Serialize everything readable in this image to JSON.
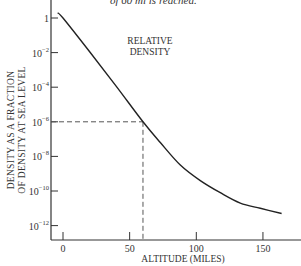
{
  "caption": {
    "text": "of 60 mi is reached."
  },
  "chart_data": {
    "type": "line",
    "title": "",
    "annotation": "RELATIVE DENSITY",
    "annotation_lines": [
      "RELATIVE",
      "DENSITY"
    ],
    "xlabel": "ALTITUDE (MILES)",
    "ylabel_lines": [
      "DENSITY AS A FRACTION",
      "OF DENSITY AT SEA LEVEL"
    ],
    "ylabel": "DENSITY AS A FRACTION OF DENSITY AT SEA LEVEL",
    "yscale": "log",
    "xlim": [
      -10,
      175
    ],
    "ylim_log10": [
      -13,
      0.3
    ],
    "x_ticks": [
      0,
      50,
      100,
      150
    ],
    "x_tick_labels": [
      "0",
      "50",
      "100",
      "150"
    ],
    "y_ticks_log10": [
      0,
      -2,
      -4,
      -6,
      -8,
      -10,
      -12
    ],
    "y_tick_labels": [
      {
        "base": "1",
        "exp": ""
      },
      {
        "base": "10",
        "exp": "−2"
      },
      {
        "base": "10",
        "exp": "−4"
      },
      {
        "base": "10",
        "exp": "−6"
      },
      {
        "base": "10",
        "exp": "−8"
      },
      {
        "base": "10",
        "exp": "−10"
      },
      {
        "base": "10",
        "exp": "−12"
      }
    ],
    "grid": false,
    "series": [
      {
        "name": "Relative density",
        "x": [
          -4,
          0,
          20,
          40,
          60,
          73,
          88,
          103,
          118,
          133,
          148,
          164
        ],
        "log10_y": [
          0.3,
          0.0,
          -1.95,
          -3.95,
          -6.0,
          -7.2,
          -8.5,
          -9.4,
          -10.1,
          -10.7,
          -11.0,
          -11.3
        ]
      }
    ],
    "reference_lines": [
      {
        "type": "dashed",
        "x": 60,
        "log10_y": -6,
        "description": "Altitude of 60 miles corresponds to relative density of 10^-6"
      }
    ]
  }
}
